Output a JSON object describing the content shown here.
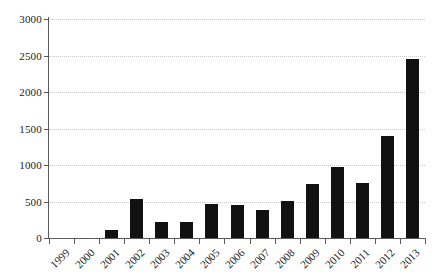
{
  "chart_data": {
    "type": "bar",
    "title": "",
    "subtitle": "",
    "xlabel": "",
    "ylabel": "",
    "categories": [
      "1999",
      "2000",
      "2001",
      "2002",
      "2003",
      "2004",
      "2005",
      "2006",
      "2007",
      "2008",
      "2009",
      "2010",
      "2011",
      "2012",
      "2013"
    ],
    "values": [
      0,
      0,
      110,
      530,
      215,
      225,
      460,
      455,
      380,
      510,
      740,
      970,
      755,
      1400,
      2450
    ],
    "series": [
      {
        "name": "",
        "values": [
          0,
          0,
          110,
          530,
          215,
          225,
          460,
          455,
          380,
          510,
          740,
          970,
          755,
          1400,
          2450
        ]
      }
    ],
    "ylim": [
      0,
      3000
    ],
    "yticks": [
      0,
      500,
      1000,
      1500,
      2000,
      2500,
      3000
    ],
    "ytick_labels": [
      "0",
      "500",
      "1000",
      "1500",
      "2000",
      "2500",
      "3000"
    ],
    "xtick_labels": [
      "1999",
      "2000",
      "2001",
      "2002",
      "2003",
      "2004",
      "2005",
      "2006",
      "2007",
      "2008",
      "2009",
      "2010",
      "2011",
      "2012",
      "2013"
    ],
    "grid": true,
    "grid_axis": "y",
    "grid_style": "dotted",
    "legend": false,
    "legend_position": "none",
    "bar_color": "#111111",
    "grid_color": "#c9c9c9",
    "axis_color": "#5a5a5a",
    "background_color": "#ffffff",
    "xtick_rotation": -45
  }
}
